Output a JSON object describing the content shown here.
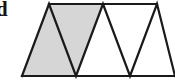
{
  "figure": {
    "label": "d",
    "label_name": "part-label-d",
    "canvas": {
      "width": 175,
      "height": 81
    },
    "colors": {
      "shaded_fill": "#d6d6d6",
      "unshaded_fill": "#ffffff",
      "stroke": "#1a1a1a",
      "background": "#ffffff",
      "label": "#141414"
    },
    "stroke_width": 2.2,
    "geometry": {
      "baseline_y": 76,
      "apex_y": 4,
      "baseline_x_start": 22,
      "baseline_x_end": 175,
      "top_vertices_x": [
        49,
        103,
        157
      ],
      "bottom_vertices_x": [
        22,
        76,
        130,
        175
      ]
    },
    "shaded_region": {
      "name": "shaded-parallelogram",
      "points": "22,76 49,4 103,4 76,76",
      "triangle_count": 2
    },
    "outline_polyline": {
      "name": "triangle-zigzag",
      "points": "22,76 49,4 76,76 103,4 130,76 157,4 175,76"
    },
    "baseline": {
      "name": "figure-baseline",
      "x1": 22,
      "y1": 76,
      "x2": 175,
      "y2": 76
    },
    "topline": {
      "name": "figure-topline",
      "x1": 49,
      "y1": 4,
      "x2": 157,
      "y2": 4
    }
  }
}
